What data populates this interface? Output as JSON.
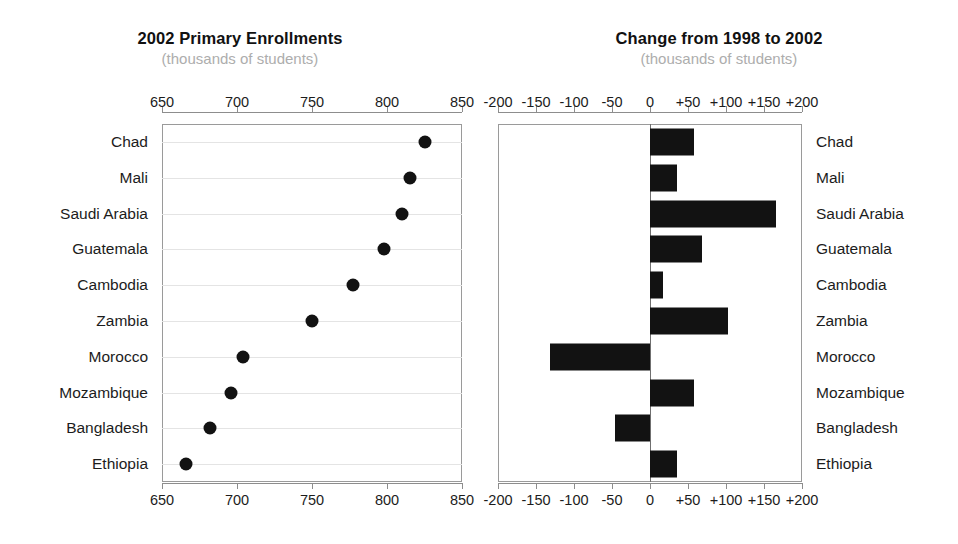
{
  "panels": {
    "left": {
      "title": "2002 Primary Enrollments",
      "subtitle": "(thousands of students)",
      "axis_ticks": [
        "650",
        "700",
        "750",
        "800",
        "850"
      ]
    },
    "right": {
      "title": "Change from 1998 to 2002",
      "subtitle": "(thousands of students)",
      "axis_ticks": [
        "-200",
        "-150",
        "-100",
        "-50",
        "0",
        "+50",
        "+100",
        "+150",
        "+200"
      ]
    }
  },
  "chart_data": [
    {
      "type": "scatter",
      "title": "2002 Primary Enrollments",
      "subtitle": "(thousands of students)",
      "xlabel": "",
      "ylabel": "",
      "xlim": [
        650,
        850
      ],
      "xticks": [
        650,
        700,
        750,
        800,
        850
      ],
      "grid": true,
      "legend": false,
      "categories": [
        "Chad",
        "Mali",
        "Saudi Arabia",
        "Guatemala",
        "Cambodia",
        "Zambia",
        "Morocco",
        "Mozambique",
        "Bangladesh",
        "Ethiopia"
      ],
      "values": [
        825,
        815,
        810,
        798,
        777,
        750,
        704,
        696,
        682,
        666
      ]
    },
    {
      "type": "bar",
      "orientation": "horizontal",
      "title": "Change from 1998 to 2002",
      "subtitle": "(thousands of students)",
      "xlabel": "",
      "ylabel": "",
      "xlim": [
        -200,
        200
      ],
      "xticks": [
        -200,
        -150,
        -100,
        -50,
        0,
        50,
        100,
        150,
        200
      ],
      "grid": false,
      "legend": false,
      "categories": [
        "Chad",
        "Mali",
        "Saudi Arabia",
        "Guatemala",
        "Cambodia",
        "Zambia",
        "Morocco",
        "Mozambique",
        "Bangladesh",
        "Ethiopia"
      ],
      "values": [
        58,
        36,
        166,
        68,
        17,
        103,
        -132,
        58,
        -46,
        35
      ]
    }
  ],
  "colors": {
    "marker": "#121212",
    "bar": "#121212",
    "axis": "#8d8d8d",
    "grid": "#e4e4e4",
    "title": "#111111",
    "subtitle": "#adadad"
  }
}
